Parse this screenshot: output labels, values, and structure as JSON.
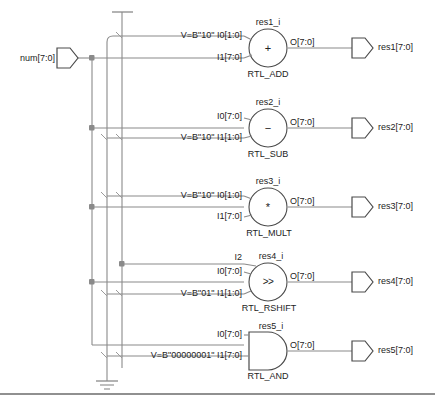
{
  "diagram": {
    "colors": {
      "wire": "#8a8a8a",
      "bus": "#8a8a8a",
      "outline": "#4a4a4a",
      "text": "#1d1d1d",
      "junction": "#8a8a8a",
      "background": "#ffffff",
      "border": "#6b6b6b"
    },
    "input_ports": [
      {
        "name": "num-port",
        "label": "num[7:0]"
      }
    ],
    "output_ports": [
      {
        "name": "res1-port",
        "label": "res1[7:0]"
      },
      {
        "name": "res2-port",
        "label": "res2[7:0]"
      },
      {
        "name": "res3-port",
        "label": "res3[7:0]"
      },
      {
        "name": "res4-port",
        "label": "res4[7:0]"
      },
      {
        "name": "res5-port",
        "label": "res5[7:0]"
      }
    ],
    "blocks": [
      {
        "id": "res1",
        "instance": "res1_i",
        "type": "RTL_ADD",
        "symbol": "+",
        "shape": "circle",
        "inputs": [
          {
            "pin": "I0[1:0]",
            "const": "V=B\"10\""
          },
          {
            "pin": "I1[7:0]",
            "const": ""
          }
        ],
        "output": "O[7:0]"
      },
      {
        "id": "res2",
        "instance": "res2_i",
        "type": "RTL_SUB",
        "symbol": "−",
        "shape": "circle",
        "inputs": [
          {
            "pin": "I0[7:0]",
            "const": ""
          },
          {
            "pin": "I1[1:0]",
            "const": "V=B\"10\""
          }
        ],
        "output": "O[7:0]"
      },
      {
        "id": "res3",
        "instance": "res3_i",
        "type": "RTL_MULT",
        "symbol": "*",
        "shape": "circle",
        "inputs": [
          {
            "pin": "I0[1:0]",
            "const": "V=B\"10\""
          },
          {
            "pin": "I1[7:0]",
            "const": ""
          }
        ],
        "output": "O[7:0]"
      },
      {
        "id": "res4",
        "instance": "res4_i",
        "type": "RTL_RSHIFT",
        "symbol": ">>",
        "shape": "circle",
        "inputs": [
          {
            "pin": "I2",
            "const": ""
          },
          {
            "pin": "I0[7:0]",
            "const": ""
          },
          {
            "pin": "I1[1:0]",
            "const": "V=B\"01\""
          }
        ],
        "output": "O[7:0]"
      },
      {
        "id": "res5",
        "instance": "res5_i",
        "type": "RTL_AND",
        "symbol": "",
        "shape": "and-gate",
        "inputs": [
          {
            "pin": "I0[7:0]",
            "const": ""
          },
          {
            "pin": "I1[7:0]",
            "const": "V=B\"00000001\""
          }
        ],
        "output": "O[7:0]"
      }
    ],
    "power_symbols": [
      {
        "name": "vcc-symbol",
        "kind": "vcc"
      },
      {
        "name": "gnd-symbol",
        "kind": "gnd"
      }
    ]
  }
}
